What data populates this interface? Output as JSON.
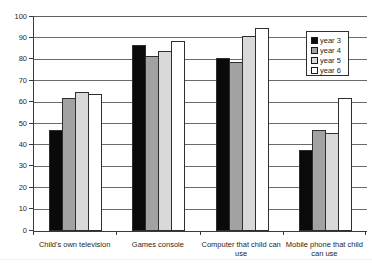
{
  "figure": {
    "background": "#ffffff",
    "axis_color": "#3a3a3a",
    "gridline_color": "#6a6a6a"
  },
  "chart_data": {
    "type": "bar",
    "title": "",
    "xlabel": "",
    "ylabel": "",
    "categories": [
      "Child's own television",
      "Games console",
      "Computer that child can use",
      "Mobile phone that child can use"
    ],
    "series": [
      {
        "name": "year 3",
        "color": "#0a0a0a",
        "values": [
          47,
          87,
          81,
          38
        ]
      },
      {
        "name": "year 4",
        "color": "#a2a2a2",
        "values": [
          62,
          82,
          79,
          47
        ]
      },
      {
        "name": "year 5",
        "color": "#d9d9d9",
        "values": [
          65,
          84,
          91,
          46
        ]
      },
      {
        "name": "year 6",
        "color": "#ffffff",
        "values": [
          64,
          89,
          95,
          62
        ]
      }
    ],
    "ylim": [
      0,
      100
    ],
    "ytick_step": 10,
    "ytick_labels": [
      "0",
      "10",
      "20",
      "30",
      "40",
      "50",
      "60",
      "70",
      "80",
      "90",
      "100"
    ],
    "grid": true,
    "legend_position": "top-right-inside",
    "legend_entries": [
      "year 3",
      "year 4",
      "year 5",
      "year 6"
    ]
  }
}
